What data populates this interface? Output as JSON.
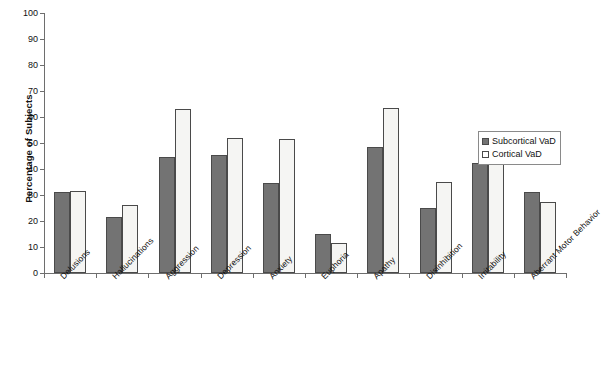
{
  "chart_data": {
    "type": "bar",
    "title": "",
    "xlabel": "",
    "ylabel": "Percentage of Subjects",
    "ylim": [
      0,
      100
    ],
    "ytick_step": 10,
    "yticks": [
      0,
      10,
      20,
      30,
      40,
      50,
      60,
      70,
      80,
      90,
      100
    ],
    "grid": false,
    "legend_position": "right-middle",
    "categories": [
      "Delusions",
      "Hallucinations",
      "Aggression",
      "Depression",
      "Anxiety",
      "Euphoria",
      "Apathy",
      "Disinhibition",
      "Irritability",
      "Aberrant Motor Behavior"
    ],
    "series": [
      {
        "name": "Subcortical VaD",
        "color": "#737373",
        "values": [
          31,
          21.5,
          44.5,
          45.5,
          34.5,
          15,
          48.5,
          25,
          42.5,
          31
        ]
      },
      {
        "name": "Cortical VaD",
        "color": "#f5f5f3",
        "values": [
          31.5,
          26,
          63,
          52,
          51.5,
          11.5,
          63.5,
          35,
          52.5,
          27.5
        ]
      }
    ]
  },
  "legend": {
    "items": [
      {
        "label": "Subcortical VaD"
      },
      {
        "label": "Cortical VaD"
      }
    ]
  }
}
